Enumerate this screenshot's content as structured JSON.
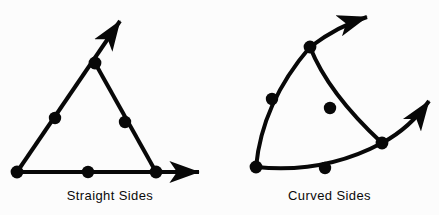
{
  "figure": {
    "background_color": "#fcfcfc",
    "ink_color": "#080808",
    "panels": [
      {
        "id": "straight-sides",
        "caption": "Straight Sides",
        "shape_type": "triangle-with-rays",
        "description": "A triangle whose three sides are straight segments; two sides extend past vertices as arrows. Seven marked dots: three vertices and three side midpoints, plus one on the base.",
        "vertices": [
          {
            "name": "bottom-left",
            "x": 17,
            "y": 172
          },
          {
            "name": "apex",
            "x": 95,
            "y": 63
          },
          {
            "name": "bottom-right",
            "x": 156,
            "y": 172
          }
        ],
        "midpoint_dots": [
          {
            "name": "left-side-midpoint",
            "x": 55,
            "y": 118
          },
          {
            "name": "base-midpoint",
            "x": 88,
            "y": 172
          },
          {
            "name": "right-side-midpoint",
            "x": 125,
            "y": 122
          }
        ],
        "arrows": [
          {
            "name": "apex-ray-arrow",
            "from_x": 95,
            "from_y": 63,
            "tip_x": 120,
            "tip_y": 21,
            "direction": "up-right"
          },
          {
            "name": "base-ray-arrow",
            "from_x": 156,
            "from_y": 172,
            "tip_x": 199,
            "tip_y": 172,
            "direction": "right"
          }
        ],
        "dot_radius": 6,
        "stroke_width": 4
      },
      {
        "id": "curved-sides",
        "caption": "Curved Sides",
        "shape_type": "curved-triangle-with-rays",
        "description": "A curvilinear triangle whose three sides are arcs; two arcs extend past vertices as arrows. Six marked dots: three vertices and three arc midpoints.",
        "vertices": [
          {
            "name": "bottom-left",
            "x": 36,
            "y": 167
          },
          {
            "name": "top",
            "x": 90,
            "y": 47
          },
          {
            "name": "right",
            "x": 162,
            "y": 143
          }
        ],
        "midpoint_dots": [
          {
            "name": "left-arc-midpoint",
            "x": 52,
            "y": 99
          },
          {
            "name": "upper-right-arc-midpoint",
            "x": 110,
            "y": 108
          },
          {
            "name": "base-arc-midpoint",
            "x": 105,
            "y": 168
          }
        ],
        "arrows": [
          {
            "name": "top-ray-arrow",
            "from_x": 90,
            "from_y": 47,
            "tip_x": 147,
            "tip_y": 17,
            "direction": "up-right"
          },
          {
            "name": "right-ray-arrow",
            "from_x": 162,
            "from_y": 143,
            "tip_x": 209,
            "tip_y": 101,
            "direction": "up-right"
          }
        ],
        "dot_radius": 6,
        "stroke_width": 4
      }
    ]
  }
}
